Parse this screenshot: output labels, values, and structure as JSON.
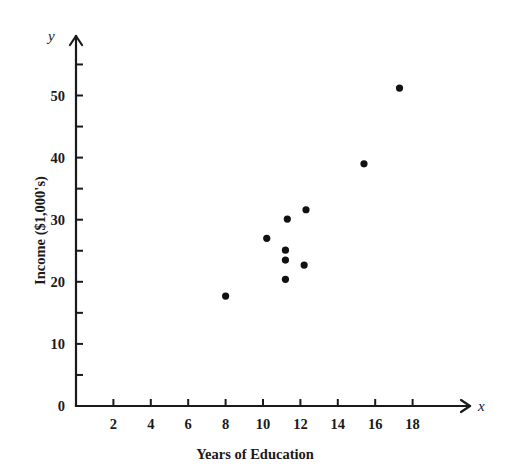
{
  "chart_data": {
    "type": "scatter",
    "title": "",
    "xlabel": "Years of Education",
    "ylabel": "Income ($1,000's)",
    "x_axis_name": "x",
    "y_axis_name": "y",
    "xlim": [
      0,
      20.2
    ],
    "ylim": [
      0,
      57
    ],
    "grid": false,
    "legend": null,
    "x_ticks_major": [
      2,
      4,
      6,
      8,
      10,
      12,
      14,
      16,
      18
    ],
    "x_tick_labels": [
      "2",
      "4",
      "6",
      "8",
      "10",
      "12",
      "14",
      "16",
      "18"
    ],
    "y_ticks_major": [
      0,
      10,
      20,
      30,
      40,
      50
    ],
    "y_tick_labels": [
      "0",
      "10",
      "20",
      "30",
      "40",
      "50"
    ],
    "y_ticks_minor": [
      5,
      15,
      25,
      35,
      45,
      55
    ],
    "origin_label": "0",
    "point_color": "#111111",
    "axis_color": "#1a1a1a",
    "points": [
      {
        "x": 8.0,
        "y": 17.7
      },
      {
        "x": 10.2,
        "y": 27.0
      },
      {
        "x": 11.2,
        "y": 25.1
      },
      {
        "x": 11.2,
        "y": 23.5
      },
      {
        "x": 11.2,
        "y": 20.4
      },
      {
        "x": 11.3,
        "y": 30.1
      },
      {
        "x": 12.2,
        "y": 22.7
      },
      {
        "x": 12.3,
        "y": 31.6
      },
      {
        "x": 15.4,
        "y": 39.0
      },
      {
        "x": 17.3,
        "y": 51.2
      }
    ]
  },
  "geometry": {
    "origin_px": {
      "x": 76,
      "y": 406
    },
    "x_unit_px": 18.7,
    "y_unit_px": 6.21,
    "x_axis_end_px": 470,
    "y_axis_top_px": 36,
    "major_tick_len": 7,
    "minor_tick_len": 7,
    "point_radius": 3.6
  }
}
